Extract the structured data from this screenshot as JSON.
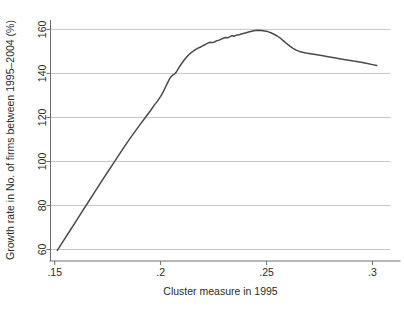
{
  "figure": {
    "background_color": "#ffffff",
    "caption_fragment": ""
  },
  "chart_data": {
    "type": "line",
    "title": "",
    "subtitle": "",
    "xlabel": "Cluster measure in 1995",
    "ylabel": "Growth rate in No. of firms between 1995–2004 (%)",
    "xlim": [
      0.148,
      0.3085
    ],
    "ylim": [
      57.5,
      162
    ],
    "xticks": [
      0.15,
      0.2,
      0.25,
      0.3
    ],
    "xticklabels": [
      ".15",
      ".2",
      ".25",
      ".3"
    ],
    "yticks": [
      60,
      80,
      100,
      120,
      140,
      160
    ],
    "yticklabels": [
      "60",
      "80",
      "100",
      "120",
      "140",
      "160"
    ],
    "grid": "horizontal",
    "legend": "none",
    "line_color": "#4a4a4a",
    "grid_color": "#c0c0c0",
    "axis_color": "#6e6e6e",
    "series": [
      {
        "name": "Growth rate",
        "x": [
          0.1512,
          0.154,
          0.157,
          0.16,
          0.163,
          0.166,
          0.169,
          0.172,
          0.175,
          0.178,
          0.181,
          0.184,
          0.187,
          0.19,
          0.1925,
          0.195,
          0.197,
          0.1985,
          0.2,
          0.2012,
          0.2022,
          0.2032,
          0.204,
          0.2048,
          0.2056,
          0.2064,
          0.2072,
          0.208,
          0.209,
          0.21,
          0.2112,
          0.2124,
          0.2136,
          0.2146,
          0.2156,
          0.2166,
          0.2176,
          0.2186,
          0.2196,
          0.2206,
          0.2216,
          0.2226,
          0.2236,
          0.2246,
          0.2256,
          0.2266,
          0.2276,
          0.2286,
          0.2296,
          0.2306,
          0.2316,
          0.2326,
          0.2336,
          0.2346,
          0.2356,
          0.237,
          0.2385,
          0.24,
          0.2415,
          0.243,
          0.2445,
          0.246,
          0.2475,
          0.249,
          0.2505,
          0.252,
          0.2535,
          0.255,
          0.2565,
          0.258,
          0.2595,
          0.261,
          0.2625,
          0.264,
          0.2655,
          0.267,
          0.2685,
          0.27,
          0.273,
          0.276,
          0.279,
          0.282,
          0.285,
          0.288,
          0.291,
          0.294,
          0.297,
          0.3,
          0.302
        ],
        "y": [
          59.6,
          63.8,
          68.3,
          72.8,
          77.3,
          81.8,
          86.3,
          90.8,
          95.2,
          99.6,
          104.0,
          108.3,
          112.4,
          116.4,
          119.6,
          122.8,
          125.6,
          127.4,
          129.6,
          131.6,
          133.6,
          135.6,
          137.2,
          138.4,
          139.2,
          139.6,
          140.4,
          141.6,
          143.2,
          144.6,
          146.2,
          147.6,
          148.8,
          149.6,
          150.3,
          150.9,
          151.5,
          151.9,
          152.4,
          152.9,
          153.4,
          153.9,
          154.2,
          154.0,
          154.4,
          154.9,
          155.1,
          155.6,
          156.0,
          156.3,
          156.2,
          156.6,
          157.2,
          156.9,
          157.3,
          157.6,
          158.0,
          158.4,
          158.8,
          159.2,
          159.5,
          159.6,
          159.5,
          159.3,
          159.0,
          158.5,
          157.8,
          157.0,
          156.0,
          154.8,
          153.5,
          152.4,
          151.4,
          150.6,
          150.0,
          149.6,
          149.3,
          149.1,
          148.6,
          148.1,
          147.6,
          147.1,
          146.6,
          146.1,
          145.6,
          145.2,
          144.6,
          144.0,
          143.6
        ]
      }
    ]
  }
}
